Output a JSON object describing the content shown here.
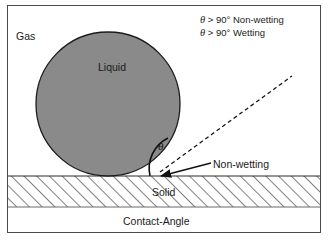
{
  "figure": {
    "caption": "Contact-Angle",
    "phases": {
      "gas": "Gas",
      "liquid": "Liquid",
      "solid": "Solid"
    },
    "angle_symbol": "θ",
    "legend": {
      "line1": {
        "symbol": "θ",
        "text": " > 90° Non-wetting"
      },
      "line2": {
        "symbol": "θ",
        "text": " > 90° Wetting"
      }
    },
    "annotation": {
      "non_wetting": "Non-wetting"
    },
    "colors": {
      "liquid_fill": "#8a8a8a",
      "outline": "#1b1b1b",
      "frame": "#4a4a4a",
      "hatch": "#4a4a4a",
      "text": "#1b1b1b",
      "background": "#ffffff"
    }
  }
}
